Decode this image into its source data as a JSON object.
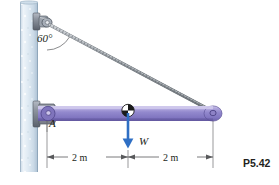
{
  "figure": {
    "label": "P5.42",
    "background": "#ffffff"
  },
  "labels": {
    "angle": "60°",
    "point_a": "A",
    "weight": "W",
    "dimension_left": "2 m",
    "dimension_right": "2 m"
  },
  "colors": {
    "wall_fill": "#dce7f0",
    "wall_edge": "#a9bccd",
    "beam_fill": "#8f84c8",
    "beam_highlight": "#c9c2e8",
    "beam_shadow": "#6f63ac",
    "bracket_fill": "#8e95a3",
    "bracket_dark": "#5d646f",
    "cable": "#9aa0a6",
    "weight_arrow": "#2f6fc4",
    "cg_dark": "#1a1a1a",
    "cg_light": "#ffffff",
    "dimension_line": "#58595b",
    "text": "#231f20"
  },
  "geometry": {
    "wall_x": 20,
    "wall_width": 18,
    "wall_top": 2,
    "wall_bottom": 172,
    "anchor_x": 47,
    "anchor_y": 24,
    "pin_x": 47,
    "pin_y": 113,
    "beam_left_x": 38,
    "beam_right_x": 213,
    "beam_top_y": 106,
    "beam_bottom_y": 121,
    "cg_x": 128,
    "cg_y": 113,
    "dim_y": 157,
    "dim_left_from": 47,
    "dim_left_to": 128,
    "dim_right_from": 128,
    "dim_right_to": 213,
    "cable_angle_deg": 60
  },
  "annotations": {
    "angle_arc_radius": 26,
    "weight_arrow_from_y": 113,
    "weight_arrow_to_y": 145
  }
}
